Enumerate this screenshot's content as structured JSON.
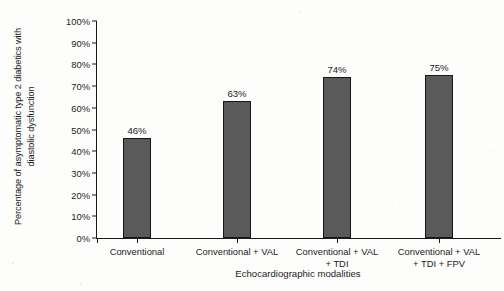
{
  "chart_data": {
    "type": "bar",
    "title": "",
    "categories": [
      "Conventional",
      "Conventional + VAL",
      "Conventional + VAL + TDI",
      "Conventional + VAL + TDI + FPV"
    ],
    "category_lines": [
      [
        "Conventional"
      ],
      [
        "Conventional + VAL"
      ],
      [
        "Conventional + VAL",
        "+ TDI"
      ],
      [
        "Conventional + VAL",
        "+ TDI + FPV"
      ]
    ],
    "values": [
      46,
      63,
      74,
      75
    ],
    "data_labels": [
      "46%",
      "63%",
      "74%",
      "75%"
    ],
    "xlabel": "Echocardiographic modalities",
    "ylabel_lines": [
      "Percentage of asymptomatic type 2 diabetics with",
      "diastolic dysfunction"
    ],
    "ylim": [
      0,
      100
    ],
    "ytick_labels": [
      "100%",
      "90%",
      "80%",
      "70%",
      "60%",
      "50%",
      "40%",
      "30%",
      "20%",
      "10%",
      "0%"
    ],
    "ytick_values": [
      100,
      90,
      80,
      70,
      60,
      50,
      40,
      30,
      20,
      10,
      0
    ],
    "grid": false,
    "legend": false,
    "unit": "%",
    "colors": {
      "bar_fill": "#5a5a5a",
      "bar_border": "#171717",
      "axis": "#1a1a1a",
      "text": "#1c1c1c",
      "background": "#fdfdfc"
    }
  }
}
